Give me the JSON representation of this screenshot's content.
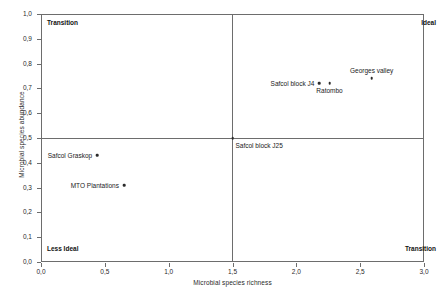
{
  "chart_data": {
    "type": "scatter",
    "title": "",
    "xlabel": "Microbial species richness",
    "ylabel": "Microbial species abundance",
    "xlim": [
      0.0,
      3.0
    ],
    "ylim": [
      0.0,
      1.0
    ],
    "xticks": [
      "0,0",
      "0,5",
      "1,0",
      "1,5",
      "2,0",
      "2,5",
      "3,0"
    ],
    "xtick_values": [
      0.0,
      0.5,
      1.0,
      1.5,
      2.0,
      2.5,
      3.0
    ],
    "yticks": [
      "0,0",
      "0,1",
      "0,2",
      "0,3",
      "0,4",
      "0,5",
      "0,6",
      "0,7",
      "0,8",
      "0,9",
      "1,0"
    ],
    "ytick_values": [
      0.0,
      0.1,
      0.2,
      0.3,
      0.4,
      0.5,
      0.6,
      0.7,
      0.8,
      0.9,
      1.0
    ],
    "grid": false,
    "legend": "none",
    "quadrant_divider_x": 1.5,
    "quadrant_divider_y": 0.5,
    "marker_color": "#2b2b2b",
    "axis_color": "#6d6d6d",
    "quadrant_labels": {
      "top_left": "Transition",
      "top_right": "Ideal",
      "bottom_left": "Less Ideal",
      "bottom_right": "Transition"
    },
    "points": [
      {
        "label": "Georges valley",
        "x": 2.59,
        "y": 0.74,
        "label_pos": "above"
      },
      {
        "label": "Safcol block J4",
        "x": 2.18,
        "y": 0.72,
        "label_pos": "left-of"
      },
      {
        "label": "Ratombo",
        "x": 2.26,
        "y": 0.72,
        "label_pos": "below"
      },
      {
        "label": "Safcol block J25",
        "x": 1.5,
        "y": 0.5,
        "label_pos": "below-right"
      },
      {
        "label": "Safcol Graskop",
        "x": 0.44,
        "y": 0.43,
        "label_pos": "left-of"
      },
      {
        "label": "MTO Plantations",
        "x": 0.65,
        "y": 0.31,
        "label_pos": "left-of"
      }
    ]
  }
}
